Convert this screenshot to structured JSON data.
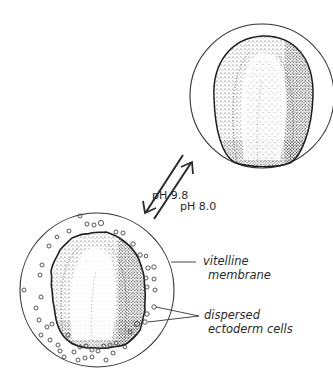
{
  "figure": {
    "type": "scientific-illustration"
  },
  "arrows": {
    "forward_label": "pH 9.8",
    "reverse_label": "pH 8.0"
  },
  "labels": {
    "vitelline_line1": "vitelline",
    "vitelline_line2": "membrane",
    "dispersed_line1": "dispersed",
    "dispersed_line2": "ectoderm cells"
  },
  "colors": {
    "ink": "#2a2a2a",
    "background": "#ffffff"
  }
}
